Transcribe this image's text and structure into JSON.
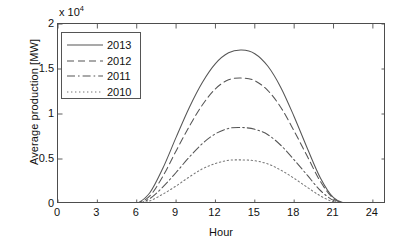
{
  "chart_data": {
    "type": "line",
    "title": "",
    "xlabel": "Hour",
    "ylabel": "Average production [MW]",
    "y_multiplier": "x 10",
    "y_multiplier_exponent": "4",
    "xlim": [
      0,
      25
    ],
    "ylim": [
      0,
      20000
    ],
    "xticks": [
      "0",
      "3",
      "6",
      "9",
      "12",
      "15",
      "18",
      "21",
      "24"
    ],
    "xtick_values": [
      0,
      3,
      6,
      9,
      12,
      15,
      18,
      21,
      24
    ],
    "yticks": [
      "0",
      "0.5",
      "1",
      "1.5",
      "2"
    ],
    "ytick_values": [
      0,
      5000,
      10000,
      15000,
      20000
    ],
    "grid": false,
    "box": true,
    "legend_position": "upper left",
    "x": [
      0,
      1,
      2,
      3,
      4,
      5,
      6,
      7,
      8,
      9,
      10,
      11,
      12,
      13,
      14,
      15,
      16,
      17,
      18,
      19,
      20,
      21,
      22,
      23,
      24
    ],
    "series": [
      {
        "name": "2013",
        "style": "solid",
        "color": "#555555",
        "peak_hour": 14,
        "peak_value": 17100,
        "values": [
          0,
          0,
          0,
          0,
          0,
          0,
          60,
          1250,
          4000,
          7400,
          10700,
          13500,
          15600,
          16800,
          17100,
          16700,
          15300,
          12900,
          9700,
          6200,
          2900,
          700,
          60,
          0,
          0
        ]
      },
      {
        "name": "2012",
        "style": "dashed",
        "color": "#555555",
        "peak_hour": 14,
        "peak_value": 14000,
        "values": [
          0,
          0,
          0,
          0,
          0,
          0,
          40,
          900,
          3100,
          5900,
          8600,
          11000,
          12800,
          13800,
          14000,
          13700,
          12600,
          10700,
          8100,
          5300,
          2500,
          600,
          50,
          0,
          0
        ]
      },
      {
        "name": "2011",
        "style": "dashdot",
        "color": "#555555",
        "peak_hour": 14,
        "peak_value": 8500,
        "values": [
          0,
          0,
          0,
          0,
          0,
          0,
          30,
          600,
          1900,
          3500,
          5200,
          6700,
          7800,
          8400,
          8500,
          8300,
          7700,
          6500,
          4900,
          3200,
          1500,
          400,
          30,
          0,
          0
        ]
      },
      {
        "name": "2010",
        "style": "dotted",
        "color": "#777777",
        "peak_hour": 14,
        "peak_value": 4900,
        "values": [
          0,
          0,
          0,
          0,
          0,
          0,
          20,
          350,
          1100,
          2000,
          3000,
          3900,
          4500,
          4850,
          4900,
          4800,
          4450,
          3750,
          2850,
          1850,
          900,
          230,
          20,
          0,
          0
        ]
      }
    ],
    "legend": [
      {
        "label": "2013",
        "style": "solid"
      },
      {
        "label": "2012",
        "style": "dashed"
      },
      {
        "label": "2011",
        "style": "dashdot"
      },
      {
        "label": "2010",
        "style": "dotted"
      }
    ]
  }
}
